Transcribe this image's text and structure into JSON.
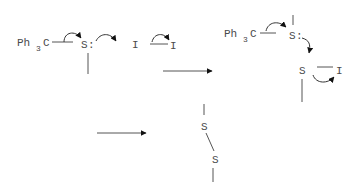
{
  "diagram": {
    "type": "reaction-mechanism",
    "colors": {
      "text": "#4a4a4a",
      "bond": "#555555",
      "arrowhead": "#111111",
      "background": "#ffffff"
    },
    "step1": {
      "reactant1": {
        "group": "Ph",
        "subscript": "3",
        "carbon": "C",
        "atom": "S",
        "lone_pair": ":"
      },
      "reactant2": {
        "atom_left": "I",
        "atom_right": "I"
      }
    },
    "step2": {
      "group": "Ph",
      "subscript": "3",
      "carbon": "C",
      "atom_top": "S",
      "lone_pair": ":",
      "atom_bottom": "S",
      "leaving": "I"
    },
    "product": {
      "atom_top": "S",
      "atom_bottom": "S"
    },
    "reaction_arrows": [
      {
        "name": "reaction-arrow-1"
      },
      {
        "name": "reaction-arrow-2"
      }
    ]
  }
}
